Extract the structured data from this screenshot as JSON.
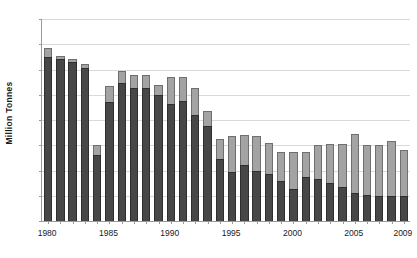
{
  "chart_data": {
    "type": "bar",
    "stacked": true,
    "title": "",
    "xlabel": "",
    "ylabel": "Million Tonnes",
    "ylim": [
      0,
      160
    ],
    "ytick_values": [
      0,
      20,
      40,
      60,
      80,
      100,
      120,
      140,
      160
    ],
    "ytick_labels": [
      "0",
      "20",
      "40",
      "60",
      "80",
      "100",
      "120",
      "140",
      "160"
    ],
    "xtick_labels": [
      "1980",
      "1985",
      "1990",
      "1995",
      "2000",
      "2005",
      "2009"
    ],
    "xtick_categories": [
      "1980",
      "1985",
      "1990",
      "1995",
      "2000",
      "2005",
      "2009"
    ],
    "grid": true,
    "legend": "none",
    "categories": [
      "1980",
      "1981",
      "1982",
      "1983",
      "1984",
      "1985",
      "1986",
      "1987",
      "1988",
      "1989",
      "1990",
      "1991",
      "1992",
      "1993",
      "1994",
      "1995",
      "1996",
      "1997",
      "1998",
      "1999",
      "2000",
      "2001",
      "2002",
      "2003",
      "2004",
      "2005",
      "2006",
      "2007",
      "2008",
      "2009"
    ],
    "series": [
      {
        "name": "lower-segment",
        "color": "#474747",
        "values": [
          130,
          128,
          126,
          121,
          52,
          94,
          109,
          105,
          105,
          100,
          93,
          95,
          84,
          75,
          49,
          39,
          44,
          40,
          37,
          32,
          25,
          35,
          33,
          30,
          27,
          22,
          21,
          20,
          20,
          20
        ]
      },
      {
        "name": "upper-segment",
        "color": "#a3a3a3",
        "values": [
          7,
          3,
          2,
          3,
          8,
          13,
          10,
          11,
          11,
          8,
          21,
          19,
          21,
          12,
          16,
          28,
          24,
          27,
          25,
          23,
          30,
          20,
          27,
          31,
          34,
          47,
          39,
          40,
          43,
          36
        ]
      }
    ],
    "totals": [
      137,
      131,
      128,
      124,
      60,
      107,
      119,
      116,
      116,
      108,
      114,
      114,
      105,
      87,
      65,
      67,
      68,
      67,
      62,
      55,
      55,
      55,
      60,
      61,
      61,
      69,
      60,
      60,
      63,
      56
    ]
  },
  "axis": {
    "y_title": "Million Tonnes"
  }
}
